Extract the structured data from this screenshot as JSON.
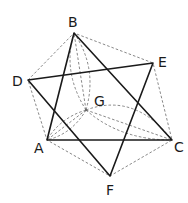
{
  "figure": {
    "points": {
      "A": {
        "label": "A",
        "x": 47,
        "y": 140
      },
      "B": {
        "label": "B",
        "x": 74,
        "y": 33
      },
      "C": {
        "label": "C",
        "x": 172,
        "y": 140
      },
      "D": {
        "label": "D",
        "x": 28,
        "y": 80
      },
      "E": {
        "label": "E",
        "x": 153,
        "y": 63
      },
      "F": {
        "label": "F",
        "x": 110,
        "y": 176
      },
      "G": {
        "label": "G",
        "x": 86,
        "y": 110
      }
    },
    "solid_triangles": [
      [
        "A",
        "B",
        "C"
      ],
      [
        "D",
        "E",
        "F"
      ]
    ],
    "dashed_hexagon": [
      "D",
      "B",
      "E",
      "C",
      "F",
      "A"
    ],
    "dashed_radials_from_G": [
      "A",
      "B",
      "C"
    ],
    "colors": {
      "solid": "#1a1a1a",
      "dashed": "#6a6a6a",
      "background": "#ffffff"
    }
  }
}
